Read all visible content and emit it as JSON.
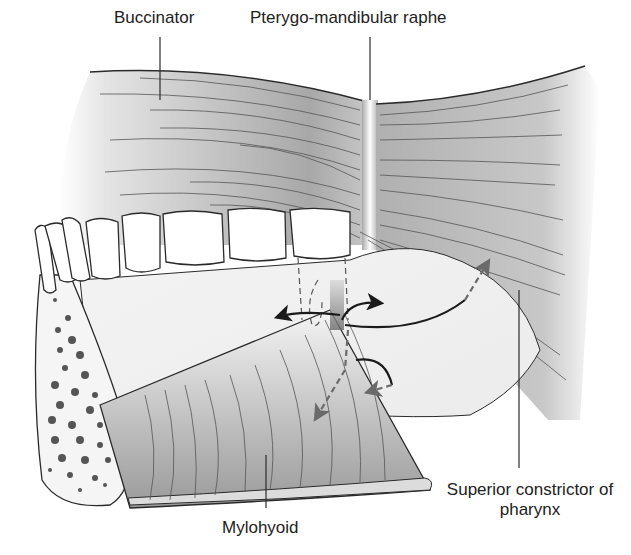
{
  "figure": {
    "type": "anatomical-illustration",
    "labels": {
      "buccinator": "Buccinator",
      "pterygo_mandibular_raphe": "Pterygo-mandibular raphe",
      "superior_constrictor": "Superior constrictor of pharynx",
      "mylohyoid": "Mylohyoid"
    },
    "colors": {
      "outline": "#2a2a2a",
      "muscle_shade": "#9a9a9a",
      "bone_spots": "#555555",
      "arrow_solid": "#1a1a1a",
      "arrow_dashed": "#6a6a6a",
      "background": "#ffffff"
    }
  }
}
